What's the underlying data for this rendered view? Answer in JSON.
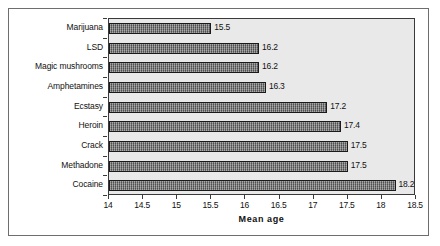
{
  "chart_data": {
    "type": "bar",
    "orientation": "horizontal",
    "title": "",
    "xlabel": "Mean age",
    "ylabel": "",
    "xlim": [
      14,
      18.5
    ],
    "xticks": [
      "14",
      "14.5",
      "15",
      "15.5",
      "16",
      "16.5",
      "17",
      "17.5",
      "18",
      "18.5"
    ],
    "xtick_values": [
      14,
      14.5,
      15,
      15.5,
      16,
      16.5,
      17,
      17.5,
      18,
      18.5
    ],
    "grid": false,
    "legend": false,
    "categories": [
      "Marijuana",
      "LSD",
      "Magic mushrooms",
      "Amphetamines",
      "Ecstasy",
      "Heroin",
      "Crack",
      "Methadone",
      "Cocaine"
    ],
    "values": [
      15.5,
      16.2,
      16.2,
      16.3,
      17.2,
      17.4,
      17.5,
      17.5,
      18.2
    ],
    "value_labels": [
      "15.5",
      "16.2",
      "16.2",
      "16.3",
      "17.2",
      "17.4",
      "17.5",
      "17.5",
      "18.2"
    ],
    "colors": {
      "bar_fill": "#6d6d6d",
      "bar_border": "#1a1a1a",
      "plot_background": "#e9e9e9",
      "plot_border": "#3a3a3a",
      "frame_border": "#6e6e6e",
      "text": "#111111"
    }
  }
}
